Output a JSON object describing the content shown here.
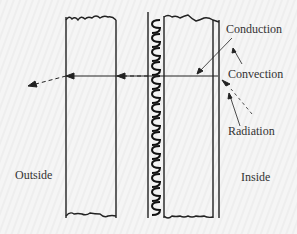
{
  "labels": {
    "conduction": "Conduction",
    "convection": "Convection",
    "radiation": "Radiation",
    "outside": "Outside",
    "inside": "Inside"
  },
  "colors": {
    "line": "#222222",
    "background": "#f4f4f4",
    "text": "#333333"
  }
}
